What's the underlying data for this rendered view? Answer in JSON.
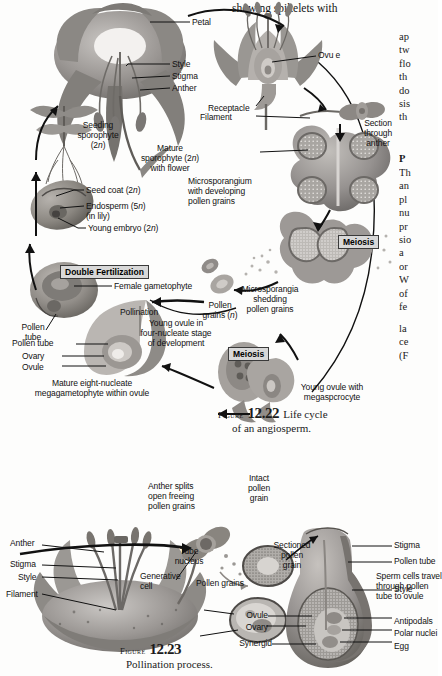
{
  "page": {
    "top_text": "showing spikelets with",
    "right_column": {
      "para1": [
        "ap",
        "tw",
        "flo",
        "th",
        "do",
        "sis",
        "th"
      ],
      "heading": "P",
      "para2": [
        "Th",
        "an",
        "pl",
        "nu",
        "pr",
        "sio",
        "a",
        "or",
        "W",
        "of",
        "fe"
      ],
      "para3": [
        "la",
        "ce",
        "(F"
      ]
    }
  },
  "figure1": {
    "caption_prefix": "Figure",
    "caption_number": "12.22",
    "caption_line1": "Life cycle",
    "caption_line2": "of an angiosperm.",
    "badges": {
      "double_fertilization": "Double Fertilization",
      "meiosis_top": "Meiosis",
      "meiosis_bottom": "Meiosis"
    },
    "labels": {
      "petal": "Petal",
      "style": "Style",
      "stigma": "Stigma",
      "anther": "Anther",
      "receptacle": "Receptacle",
      "filament": "Filament",
      "ovule": "Ovu e",
      "section_through_anther": "Section\nthrough\nanther",
      "seeding_sporophyte": "Seeding\nsporophyte\n(2n)",
      "mature_sporophyte": "Mature\nsporophyte (2n)\nwith flower",
      "seed_coat": "Seed coat (2n)",
      "endosperm": "Endosperm (5n)\n(in lily)",
      "young_embryo": "Young embryo (2n)",
      "microsporangium": "Microsporangium\nwith developing\npollen grains",
      "microsporangia": "Microsporangia\nshedding\npollen grains",
      "female_gametophyte": "Female gametophyte",
      "pollination": "Pollination",
      "pollen_grains_n": "Pollen\ngrains (n)",
      "pollen_tube_short": "Pollen\ntube",
      "pollen_tube": "Pollen tube",
      "ovary": "Ovary",
      "ovule_lower": "Ovule",
      "mature_eight": "Mature eight-nucleate\nmegagametophyte within ovule",
      "young_ovule_four": "Young ovule in\nfour-nucleate stage\nof development",
      "young_ovule_mega": "Young ovule with\nmegaspcrocyte"
    }
  },
  "figure2": {
    "caption_prefix": "Figure",
    "caption_number": "12.23",
    "caption_line1": "Pollination process.",
    "labels": {
      "anther": "Anther",
      "stigma_left": "Stigma",
      "style_left": "Style",
      "filament": "Filament",
      "anther_splits": "Anther splits\nopen freeing\npollen grains",
      "intact_pollen": "Intact\npollen\ngrain",
      "sectioned_pollen": "Sectioned\npollen\ngrain",
      "tube_nucleus": "Tube\nnucleus",
      "generative_cell": "Generative\ncell",
      "pollen_grains": "Pollen grains",
      "stigma_right": "Stigma",
      "pollen_tube_right": "Pollen tube",
      "sperm_cells": "Sperm cells travel\nthrough pollen\ntube to ovule",
      "style_right": "Style",
      "ovule": "Ovule",
      "ovary": "Ovary",
      "synergid": "Synergid",
      "antipodals": "Antipodals",
      "polar_nuclei": "Polar nuclei",
      "egg": "Egg"
    }
  },
  "colors": {
    "ink": "#111111",
    "badge_bg": "#d8d8d8",
    "art_mid": "#8e8e8e",
    "art_dark": "#5a5a5a",
    "art_light": "#c9c9c9"
  }
}
